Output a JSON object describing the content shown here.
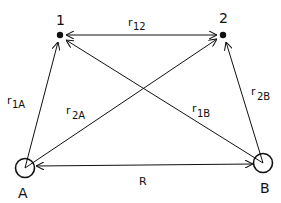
{
  "diagram": {
    "type": "vector-distance-diagram",
    "nodes": [
      {
        "id": "1",
        "label": "1",
        "kind": "electron",
        "x": 60,
        "y": 35
      },
      {
        "id": "2",
        "label": "2",
        "kind": "electron",
        "x": 223,
        "y": 35
      },
      {
        "id": "A",
        "label": "A",
        "kind": "nucleus",
        "x": 25,
        "y": 168
      },
      {
        "id": "B",
        "label": "B",
        "kind": "nucleus",
        "x": 263,
        "y": 163
      }
    ],
    "edges": [
      {
        "id": "r12",
        "from": "1",
        "to": "2",
        "label": "r",
        "sub": "12",
        "arrow": "both"
      },
      {
        "id": "r1A",
        "from": "A",
        "to": "1",
        "label": "r",
        "sub": "1A",
        "arrow": "end"
      },
      {
        "id": "r2A",
        "from": "A",
        "to": "2",
        "label": "r",
        "sub": "2A",
        "arrow": "end"
      },
      {
        "id": "r1B",
        "from": "B",
        "to": "1",
        "label": "r",
        "sub": "1B",
        "arrow": "end"
      },
      {
        "id": "r2B",
        "from": "B",
        "to": "2",
        "label": "r",
        "sub": "2B",
        "arrow": "end"
      },
      {
        "id": "R",
        "from": "A",
        "to": "B",
        "label": "R",
        "sub": "",
        "arrow": "both"
      }
    ]
  },
  "labels": {
    "node1": "1",
    "node2": "2",
    "nodeA": "A",
    "nodeB": "B",
    "r": "r",
    "r12_sub": "12",
    "r1A_sub": "1A",
    "r2A_sub": "2A",
    "r1B_sub": "1B",
    "r2B_sub": "2B",
    "R": "R"
  },
  "colors": {
    "stroke": "#111111",
    "background": "#ffffff"
  }
}
